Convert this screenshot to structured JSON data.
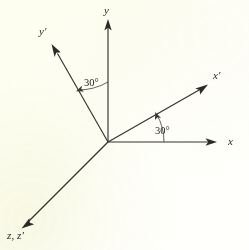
{
  "figure": {
    "background_color": "#fdfdf2",
    "stroke_color": "#33322e",
    "origin": {
      "x": 108,
      "y": 142
    }
  },
  "axes": [
    {
      "key": "y",
      "label": "y",
      "name": "y-axis",
      "from": {
        "x": 108,
        "y": 142
      },
      "to": {
        "x": 108,
        "y": 20
      },
      "label_pos": {
        "x": 104,
        "y": 6
      }
    },
    {
      "key": "x",
      "label": "x",
      "name": "x-axis",
      "from": {
        "x": 108,
        "y": 142
      },
      "to": {
        "x": 216,
        "y": 142
      },
      "label_pos": {
        "x": 228,
        "y": 137
      }
    },
    {
      "key": "y_prime",
      "label": "y′",
      "name": "y-prime-axis",
      "from": {
        "x": 108,
        "y": 142
      },
      "to": {
        "x": 52,
        "y": 45
      },
      "label_pos": {
        "x": 40,
        "y": 27
      }
    },
    {
      "key": "x_prime",
      "label": "x′",
      "name": "x-prime-axis",
      "from": {
        "x": 108,
        "y": 142
      },
      "to": {
        "x": 207,
        "y": 85
      },
      "label_pos": {
        "x": 214,
        "y": 71
      }
    },
    {
      "key": "z_zprime",
      "label": "z, z′",
      "name": "z-and-z-prime-axis",
      "from": {
        "x": 108,
        "y": 142
      },
      "to": {
        "x": 22,
        "y": 228
      },
      "label_pos": {
        "x": 8,
        "y": 231
      }
    }
  ],
  "angles": [
    {
      "key": "angle_y_yprime",
      "value": "30°",
      "name": "angle-label-y-to-yprime",
      "label_pos": {
        "x": 84,
        "y": 79
      },
      "radius": 60,
      "from_deg": 90,
      "to_deg": 120
    },
    {
      "key": "angle_x_xprime",
      "value": "30°",
      "name": "angle-label-x-to-xprime",
      "label_pos": {
        "x": 156,
        "y": 127
      },
      "radius": 56,
      "from_deg": 0,
      "to_deg": 30
    }
  ]
}
